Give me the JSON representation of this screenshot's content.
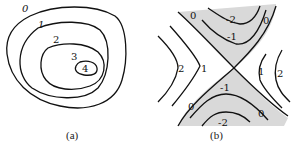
{
  "figure": {
    "panel_a": {
      "caption": "(a)",
      "description": "Nested closed contour lines around a peak",
      "contour_labels": [
        "0",
        "1",
        "2",
        "3",
        "4"
      ]
    },
    "panel_b": {
      "caption": "(b)",
      "description": "Saddle point contour map with shaded negative regions",
      "labels": {
        "top_0_left": "0",
        "top_minus2": "-2",
        "top_0_right": "0",
        "top_minus1": "-1",
        "left_2": "2",
        "left_1": "1",
        "right_1": "1",
        "right_2": "2",
        "bottom_minus1": "-1",
        "bottom_0_left": "0",
        "bottom_0_right": "0",
        "bottom_minus2": "-2"
      },
      "shade_color": "#d9d9d9"
    }
  }
}
